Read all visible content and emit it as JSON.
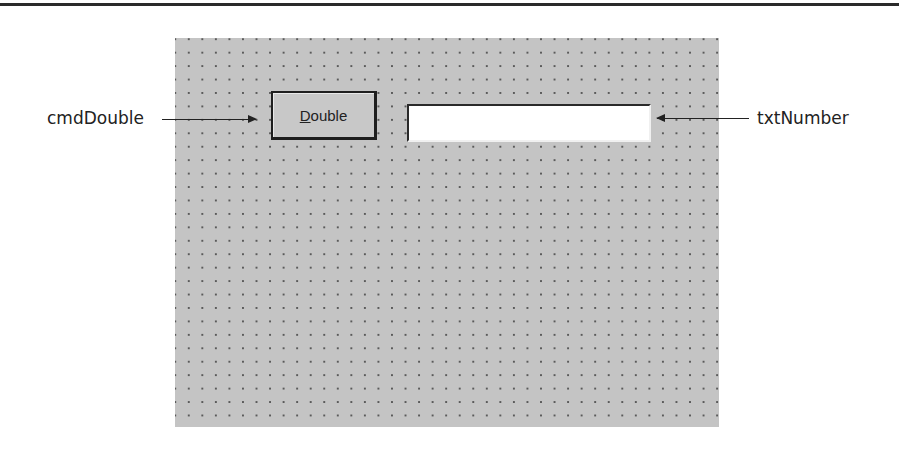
{
  "diagram": {
    "form": {
      "grid": "dotted design-time grid",
      "background_color": "#c4c4c4"
    },
    "button": {
      "name": "cmdDouble",
      "label_accelerator": "D",
      "label_rest": "ouble"
    },
    "textbox": {
      "name": "txtNumber",
      "value": ""
    },
    "callouts": {
      "left": "cmdDouble",
      "right": "txtNumber"
    }
  }
}
